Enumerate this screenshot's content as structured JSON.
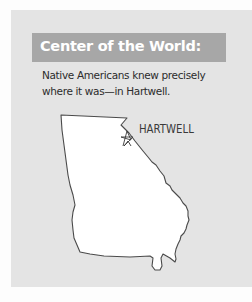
{
  "sidebar_box": {
    "title": "Center of the World:",
    "body": "Native Americans knew precisely where it was—in Hartwell.",
    "colors": {
      "panel_background": "#e4e4e4",
      "header_background": "#a7a7a7",
      "header_text": "#ffffff",
      "body_text": "#2c2c2c"
    }
  },
  "map": {
    "subject": "Georgia state outline",
    "label": "HARTWELL",
    "marker": "star-icon",
    "fill": "#ffffff",
    "stroke": "#4a4a4a"
  }
}
